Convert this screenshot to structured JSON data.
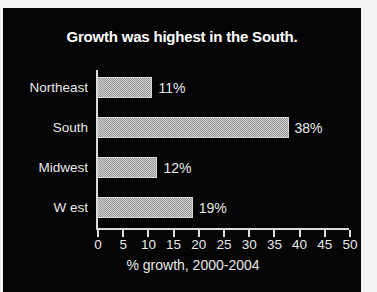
{
  "chart_data": {
    "type": "bar",
    "orientation": "horizontal",
    "title": "Growth was highest in the South.",
    "categories": [
      "Northeast",
      "South",
      "Midwest",
      "W est"
    ],
    "values": [
      11,
      38,
      12,
      19
    ],
    "value_labels": [
      "11%",
      "38%",
      "12%",
      "19%"
    ],
    "xlabel": "% growth, 2000-2004",
    "ylabel": "",
    "xlim": [
      0,
      50
    ],
    "xticks": [
      0,
      5,
      10,
      15,
      20,
      25,
      30,
      35,
      40,
      45,
      50
    ],
    "xtick_labels": [
      "0",
      "5",
      "10",
      "15",
      "20",
      "25",
      "30",
      "35",
      "40",
      "45",
      "50"
    ],
    "grid": false,
    "legend": null,
    "colors": {
      "background": "#050505",
      "text": "#e8e8e8",
      "title": "#ffffff",
      "bar_fill": "#9a9a9a",
      "bar_border": "#d6d6d6",
      "axis": "#dcdcdc",
      "page_edge": "#f4f3f1"
    }
  }
}
